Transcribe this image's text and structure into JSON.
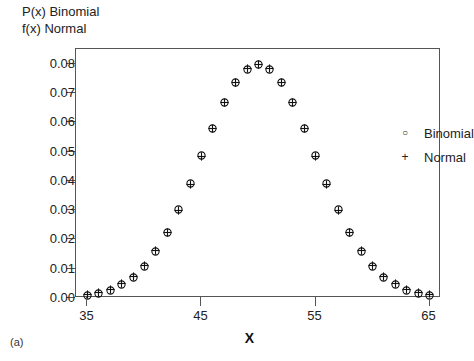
{
  "figure": {
    "subfigure_label": "(a)",
    "y_axis_title_lines": [
      "P(x) Binomial",
      "f(x) Normal"
    ],
    "x_axis_label": "X"
  },
  "legend": {
    "position": "top-right-inside",
    "entries": [
      {
        "marker": "circle-icon",
        "glyph": "○",
        "label": "Binomial"
      },
      {
        "marker": "plus-icon",
        "glyph": "+",
        "label": "Normal"
      }
    ]
  },
  "chart_data": {
    "type": "scatter",
    "title": "",
    "subtitle": "",
    "xlabel": "X",
    "ylabel": "P(x) Binomial / f(x) Normal",
    "xlim": [
      34,
      66
    ],
    "ylim": [
      0.0,
      0.085
    ],
    "grid": false,
    "legend_position": "upper right",
    "x_ticks": [
      35,
      45,
      55,
      65
    ],
    "x_tick_labels": [
      "35",
      "45",
      "55",
      "65"
    ],
    "y_ticks": [
      0.0,
      0.01,
      0.02,
      0.03,
      0.04,
      0.05,
      0.06,
      0.07,
      0.08
    ],
    "y_tick_labels": [
      "0.00",
      "0.01",
      "0.02",
      "0.03",
      "0.04",
      "0.05",
      "0.06",
      "0.07",
      "0.08"
    ],
    "x": [
      35,
      36,
      37,
      38,
      39,
      40,
      41,
      42,
      43,
      44,
      45,
      46,
      47,
      48,
      49,
      50,
      51,
      52,
      53,
      54,
      55,
      56,
      57,
      58,
      59,
      60,
      61,
      62,
      63,
      64,
      65
    ],
    "series": [
      {
        "name": "Binomial",
        "marker": "circle",
        "values": [
          0.0009,
          0.0016,
          0.0027,
          0.0045,
          0.0071,
          0.0108,
          0.0159,
          0.0223,
          0.0301,
          0.039,
          0.0485,
          0.058,
          0.0666,
          0.0735,
          0.078,
          0.0796,
          0.078,
          0.0735,
          0.0666,
          0.058,
          0.0485,
          0.039,
          0.0301,
          0.0223,
          0.0159,
          0.0108,
          0.0071,
          0.0045,
          0.0027,
          0.0016,
          0.0009
        ]
      },
      {
        "name": "Normal",
        "marker": "plus",
        "values": [
          0.0011,
          0.0018,
          0.003,
          0.0048,
          0.0074,
          0.0111,
          0.0161,
          0.0224,
          0.03,
          0.0388,
          0.0484,
          0.0579,
          0.0666,
          0.0736,
          0.0782,
          0.0798,
          0.0782,
          0.0736,
          0.0666,
          0.0579,
          0.0484,
          0.0388,
          0.03,
          0.0224,
          0.0161,
          0.0111,
          0.0074,
          0.0048,
          0.003,
          0.0018,
          0.0011
        ]
      }
    ]
  }
}
